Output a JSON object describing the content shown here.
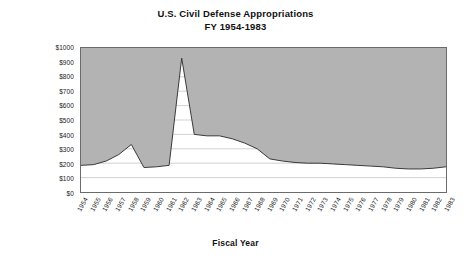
{
  "chart_data": {
    "type": "area",
    "title": "U.S. Civil Defense Appropriations",
    "subtitle": "FY 1954-1983",
    "xlabel": "Fiscal Year",
    "ylabel_line1": "Millions",
    "ylabel_line2": "(FY 1982 Constant Dollars)",
    "ylim": [
      0,
      1000
    ],
    "ytick_values": [
      0,
      100,
      200,
      300,
      400,
      500,
      600,
      700,
      800,
      900,
      1000
    ],
    "ytick_labels": [
      "$0",
      "$100",
      "$200",
      "$300",
      "$400",
      "$500",
      "$600",
      "$700",
      "$800",
      "$900",
      "$1000"
    ],
    "grid": true,
    "legend": "none",
    "fill_direction": "above-line",
    "series_name": "Appropriations",
    "categories": [
      "1954",
      "1955",
      "1956",
      "1957",
      "1958",
      "1959",
      "1960",
      "1961",
      "1962",
      "1963",
      "1964",
      "1965",
      "1966",
      "1967",
      "1968",
      "1969",
      "1970",
      "1971",
      "1972",
      "1973",
      "1974",
      "1975",
      "1976",
      "1977",
      "1978",
      "1979",
      "1980",
      "1981",
      "1982",
      "1983"
    ],
    "values": [
      185,
      190,
      215,
      260,
      330,
      170,
      175,
      185,
      930,
      400,
      390,
      390,
      370,
      340,
      300,
      230,
      215,
      205,
      200,
      200,
      195,
      190,
      185,
      180,
      175,
      165,
      160,
      160,
      165,
      175
    ],
    "colors": {
      "fill": "#b3b3b3",
      "line": "#3a3a3a",
      "axis": "#6b6b6b",
      "grid": "#a2a2a2",
      "text": "#111111"
    }
  }
}
